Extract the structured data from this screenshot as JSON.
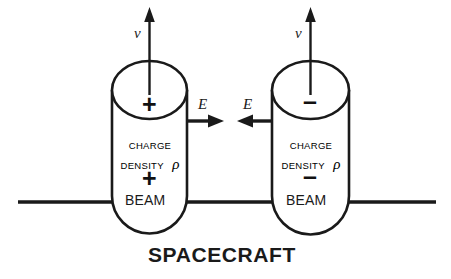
{
  "figure": {
    "caption": "SPACECRAFT",
    "background_color": "#ffffff",
    "stroke_color": "#1a1a1a"
  },
  "left_emitter": {
    "name": "positive beam cylinder",
    "top_sign": "+",
    "charge_label_line1": "CHARGE",
    "charge_label_line2": "DENSITY",
    "charge_symbol": "ρ",
    "body_sign": "+",
    "beam_label": "BEAM",
    "velocity_label": "v",
    "field_label": "E",
    "field_direction": "right"
  },
  "right_emitter": {
    "name": "negative beam cylinder",
    "top_sign": "–",
    "charge_label_line1": "CHARGE",
    "charge_label_line2": "DENSITY",
    "charge_symbol": "ρ",
    "body_sign": "–",
    "beam_label": "BEAM",
    "velocity_label": "v",
    "field_label": "E",
    "field_direction": "left"
  },
  "spacecraft": {
    "label": "SPACECRAFT"
  }
}
